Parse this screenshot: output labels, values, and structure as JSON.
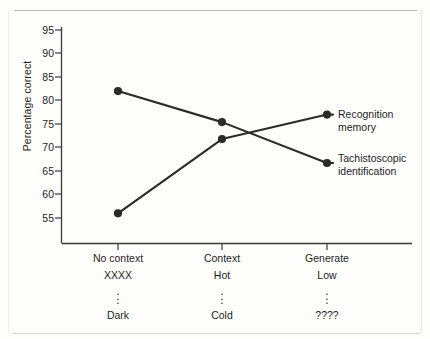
{
  "chart_data": {
    "type": "line",
    "title": "",
    "xlabel": "",
    "ylabel": "Percentage correct",
    "ylim": [
      51,
      97
    ],
    "yticks": [
      55,
      60,
      65,
      70,
      75,
      80,
      85,
      90,
      95
    ],
    "grid": false,
    "legend_position": "right-inline",
    "categories": [
      "No context",
      "Context",
      "Generate"
    ],
    "category_sublabels": [
      {
        "line1": "No context",
        "line2": "XXXX",
        "dots": "⋮",
        "line4": "Dark"
      },
      {
        "line1": "Context",
        "line2": "Hot",
        "dots": "⋮",
        "line4": "Cold"
      },
      {
        "line1": "Generate",
        "line2": "Low",
        "dots": "⋮",
        "line4": "????"
      }
    ],
    "series": [
      {
        "name": "Tachistoscopic identification",
        "label_line1": "Tachistoscopic",
        "label_line2": "identification",
        "values": [
          82.0,
          75.4,
          66.7
        ],
        "color": "#2b2b2b"
      },
      {
        "name": "Recognition memory",
        "label_line1": "Recognition",
        "label_line2": "memory",
        "values": [
          56.0,
          71.8,
          77.0
        ],
        "color": "#2b2b2b"
      }
    ]
  },
  "ytick_labels": [
    "95",
    "90",
    "85",
    "80",
    "75",
    "70",
    "65",
    "60",
    "55"
  ],
  "colors": {
    "line": "#2b2b2b",
    "marker": "#2b2b2b",
    "axis": "#3a3a3a",
    "text": "#1d1d1d",
    "page_rule": "#b9b9b9",
    "background": "#fdfdfc"
  }
}
